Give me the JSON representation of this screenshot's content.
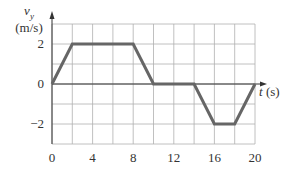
{
  "chart_data": {
    "type": "line",
    "title": "",
    "xlabel": "t (s)",
    "ylabel": "v_y (m/s)",
    "ylabel_var": "v",
    "ylabel_sub": "y",
    "ylabel_unit": "(m/s)",
    "xlabel_var": "t",
    "xlabel_unit": "(s)",
    "xlim": [
      0,
      20
    ],
    "ylim": [
      -3,
      3
    ],
    "grid": true,
    "x_grid_step": 2,
    "y_grid_step": 1,
    "x_ticks": [
      "0",
      "4",
      "8",
      "12",
      "16",
      "20"
    ],
    "y_ticks": [
      "2",
      "0",
      "−2"
    ],
    "series": [
      {
        "name": "v_y",
        "x": [
          0,
          2,
          8,
          10,
          14,
          16,
          18,
          20
        ],
        "y": [
          0,
          2,
          2,
          0,
          0,
          -2,
          -2,
          0
        ]
      }
    ],
    "colors": {
      "line": "#666666",
      "grid": "#b0b0b0",
      "axis": "#333333"
    }
  }
}
